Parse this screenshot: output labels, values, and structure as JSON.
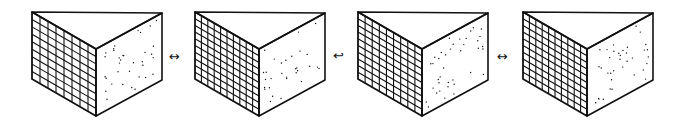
{
  "diagram": {
    "stroke_color": "#111111",
    "background": "#ffffff",
    "prisms": [
      {
        "id": "prism-1",
        "offset_x": 0,
        "grid_cols": 8,
        "grid_rows": 9,
        "dot_count": 34
      },
      {
        "id": "prism-2",
        "offset_x": 163,
        "grid_cols": 10,
        "grid_rows": 10,
        "dot_count": 30
      },
      {
        "id": "prism-3",
        "offset_x": 326,
        "grid_cols": 9,
        "grid_rows": 10,
        "dot_count": 38
      },
      {
        "id": "prism-4",
        "offset_x": 491,
        "grid_cols": 10,
        "grid_rows": 10,
        "dot_count": 36
      }
    ],
    "arrows": [
      {
        "id": "arrow-1",
        "glyph": "↔",
        "x": 172,
        "y": 58
      },
      {
        "id": "arrow-2",
        "glyph": "↩",
        "x": 336,
        "y": 57
      },
      {
        "id": "arrow-3",
        "glyph": "↔",
        "x": 500,
        "y": 58
      }
    ]
  }
}
